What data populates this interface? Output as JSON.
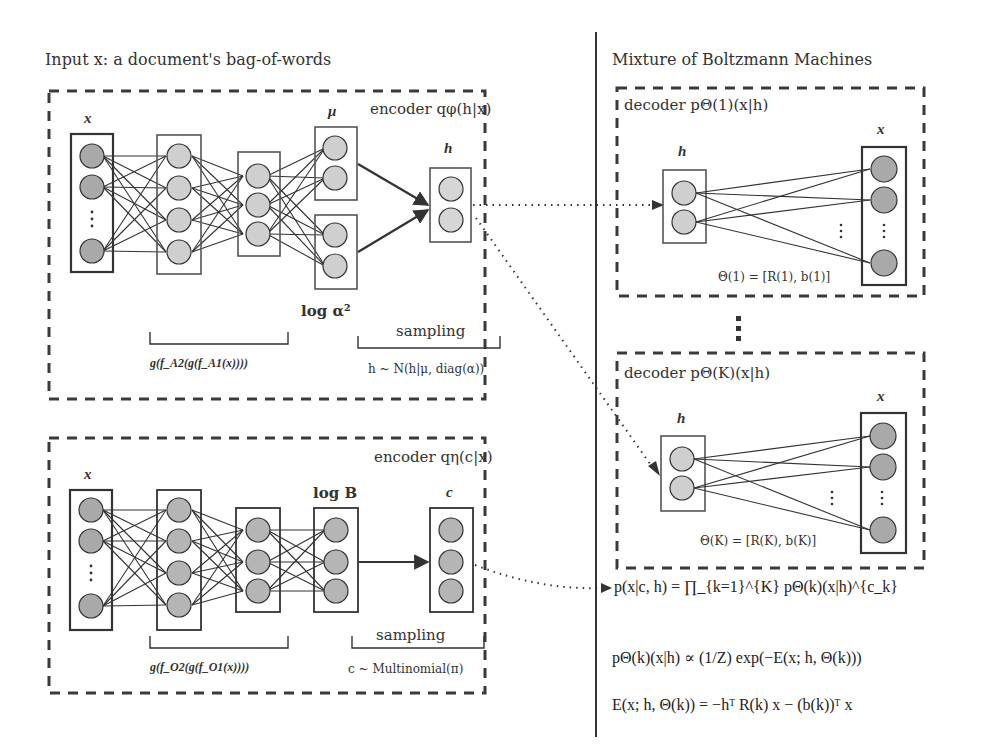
{
  "left_panel": {
    "header": "Input x: a document's bag-of-words",
    "encoder_h": {
      "title": "encoder qφ(h|x)",
      "layers": [
        {
          "label": "x",
          "nodes": 3,
          "ellipsis": true,
          "node_color": "#a9a9a9"
        },
        {
          "label": "",
          "nodes": 4,
          "node_color": "#cfcfcf"
        },
        {
          "label": "",
          "nodes": 3,
          "node_color": "#cfcfcf"
        },
        {
          "label": "μ",
          "nodes": 2,
          "node_color": "#cfcfcf"
        },
        {
          "label": "log α²",
          "nodes": 2,
          "node_color": "#cfcfcf"
        },
        {
          "label": "h",
          "nodes": 2,
          "node_color": "#d6d6d6"
        }
      ],
      "bracket_network_label": "g(f_A2(g(f_A1(x))))",
      "bracket_sampling_label": "sampling",
      "sampling_formula": "h ~ N(h|μ, diag(α))"
    },
    "encoder_c": {
      "title": "encoder qη(c|x)",
      "layers": [
        {
          "label": "x",
          "nodes": 3,
          "ellipsis": true,
          "node_color": "#a9a9a9"
        },
        {
          "label": "",
          "nodes": 4,
          "node_color": "#b5b5b5"
        },
        {
          "label": "",
          "nodes": 3,
          "node_color": "#b5b5b5"
        },
        {
          "label": "log B",
          "nodes": 3,
          "node_color": "#b5b5b5"
        },
        {
          "label": "c",
          "nodes": 3,
          "node_color": "#b5b5b5"
        }
      ],
      "bracket_network_label": "g(f_O2(g(f_O1(x))))",
      "bracket_sampling_label": "sampling",
      "sampling_formula": "c ~ Multinomial(π)"
    }
  },
  "right_panel": {
    "header": "Mixture of Boltzmann Machines",
    "decoders": [
      {
        "title": "decoder pΘ(1)(x|h)",
        "h_label": "h",
        "x_label": "x",
        "params": "Θ(1) = [R(1), b(1)]"
      },
      {
        "title": "decoder pΘ(K)(x|h)",
        "h_label": "h",
        "x_label": "x",
        "params": "Θ(K) = [R(K), b(K)]"
      }
    ],
    "vertical_ellipsis": "⋮",
    "equations": [
      "p(x|c, h) = ∏_{k=1}^{K} pΘ(k)(x|h)^{c_k}",
      "pΘ(k)(x|h) ∝ (1/Z) exp(−E(x; h, Θ(k)))",
      "E(x; h, Θ(k)) = −hᵀ R(k) x − (b(k))ᵀ x"
    ]
  },
  "colors": {
    "line": "#333333",
    "dashed_border": "#3a3a3a",
    "input_node": "#a9a9a9",
    "hidden_node": "#cfcfcf",
    "background": "#ffffff"
  }
}
